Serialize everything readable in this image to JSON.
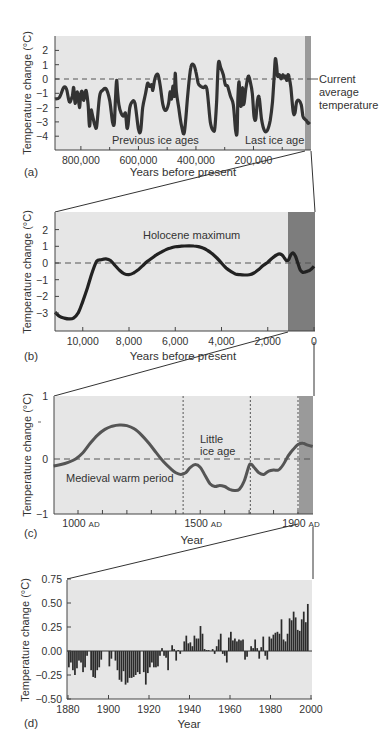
{
  "chart_data": [
    {
      "panel": "(a)",
      "type": "line",
      "title": "",
      "xlabel": "Years before present",
      "ylabel": "Temperature change (°C)",
      "x_tick_labels": [
        "800,000",
        "600,000",
        "400,000",
        "200,000"
      ],
      "y_tick_labels": [
        "2",
        "1",
        "0",
        "-1",
        "-2",
        "-3",
        "-4"
      ],
      "xlim": [
        890000,
        0
      ],
      "ylim": [
        -5,
        3
      ],
      "annotations": [
        "Previous ice ages",
        "Last ice age",
        "Current average temperature"
      ],
      "reference_line": {
        "y": 0,
        "style": "dashed",
        "label": "Current average temperature"
      },
      "highlight_region": {
        "x": [
          20000,
          0
        ],
        "color": "#9a9a9a"
      },
      "series": [
        {
          "name": "Temperature change",
          "x": [
            890000,
            875000,
            860000,
            850000,
            840000,
            830000,
            825000,
            820000,
            812000,
            805000,
            800000,
            795000,
            790000,
            782000,
            775000,
            770000,
            765000,
            760000,
            752000,
            745000,
            735000,
            725000,
            712000,
            700000,
            690000,
            684000,
            680000,
            676000,
            672000,
            668000,
            660000,
            652000,
            645000,
            640000,
            636000,
            630000,
            622000,
            612000,
            600000,
            592000,
            585000,
            575000,
            568000,
            562000,
            558000,
            554000,
            550000,
            545000,
            540000,
            532000,
            524000,
            515000,
            505000,
            495000,
            490000,
            485000,
            480000,
            475000,
            472000,
            468000,
            460000,
            450000,
            440000,
            428000,
            418000,
            408000,
            400000,
            392000,
            384000,
            374000,
            362000,
            350000,
            340000,
            334000,
            328000,
            322000,
            314000,
            305000,
            298000,
            290000,
            280000,
            270000,
            262000,
            257000,
            254000,
            250000,
            246000,
            242000,
            238000,
            234000,
            226000,
            218000,
            210000,
            204000,
            198000,
            192000,
            186000,
            180000,
            172000,
            162000,
            152000,
            142000,
            134000,
            128000,
            124000,
            120000,
            116000,
            110000,
            104000,
            98000,
            92000,
            88000,
            84000,
            80000,
            76000,
            70000,
            62000,
            56000,
            50000,
            42000,
            34000,
            28000,
            22000,
            16000,
            10000,
            4000
          ],
          "y": [
            -1.4,
            -1.3,
            -0.6,
            -0.7,
            -1.6,
            -1.2,
            -0.6,
            -1.7,
            -0.9,
            -2.0,
            -1.0,
            -0.9,
            -1.5,
            -0.8,
            -1.8,
            -3.3,
            -2.2,
            -2.5,
            -3.2,
            -3.3,
            -1.2,
            -0.8,
            -0.7,
            -1.5,
            -3.0,
            -3.1,
            -1.5,
            -0.1,
            -1.0,
            -1.8,
            -2.4,
            -2.6,
            -2.4,
            -3.4,
            -3.2,
            -2.0,
            -1.6,
            -1.7,
            -3.5,
            -3.6,
            -2.0,
            -1.0,
            -0.3,
            -0.5,
            -0.5,
            -0.4,
            -0.8,
            -0.2,
            0.2,
            0.3,
            -0.5,
            -1.8,
            -2.2,
            -1.7,
            -0.9,
            -1.4,
            -0.5,
            -1.2,
            0.4,
            -0.9,
            -2.0,
            -3.3,
            -3.7,
            -1.0,
            0.8,
            1.0,
            0.5,
            -0.3,
            -0.5,
            -0.6,
            -0.7,
            -3.0,
            -3.6,
            -3.4,
            -1.5,
            1.1,
            0.8,
            0.3,
            -0.4,
            -0.5,
            -1.2,
            -1.8,
            -3.6,
            -3.7,
            -1.3,
            -0.2,
            -1.7,
            -1.8,
            -0.6,
            -1.8,
            -0.6,
            0.2,
            -0.3,
            -1.0,
            -2.6,
            -2.8,
            -1.5,
            -1.3,
            -2.8,
            -3.6,
            -3.6,
            -2.9,
            -1.6,
            0.2,
            1.4,
            1.0,
            0.2,
            0.3,
            0.0,
            0.3,
            0.1,
            0.2,
            -0.1,
            0.3,
            0.1,
            -0.6,
            -2.3,
            -2.4,
            -1.6,
            -1.5,
            -1.8,
            -2.6,
            -2.8,
            -2.9,
            -3.1,
            -3.0
          ]
        }
      ]
    },
    {
      "panel": "(b)",
      "type": "line",
      "title": "",
      "xlabel": "Years before present",
      "ylabel": "Temperature change (°C)",
      "x_tick_labels": [
        "10,000",
        "8,000",
        "6,000",
        "4,000",
        "2,000",
        "0"
      ],
      "y_tick_labels": [
        "2",
        "1",
        "0",
        "-1",
        "-2",
        "-3"
      ],
      "xlim": [
        11200,
        0
      ],
      "ylim": [
        -4,
        3
      ],
      "annotations": [
        "Holocene maximum"
      ],
      "reference_line": {
        "y": 0,
        "style": "dashed"
      },
      "highlight_region": {
        "x": [
          1100,
          0
        ],
        "color": "#7d7d7d"
      },
      "series": [
        {
          "name": "Temperature change",
          "x": [
            11200,
            11000,
            10800,
            10600,
            10400,
            10200,
            10000,
            9800,
            9600,
            9400,
            9200,
            9000,
            8800,
            8600,
            8400,
            8200,
            8000,
            7800,
            7600,
            7400,
            7200,
            7000,
            6800,
            6600,
            6400,
            6200,
            6000,
            5800,
            5600,
            5400,
            5200,
            5000,
            4800,
            4600,
            4400,
            4200,
            4000,
            3800,
            3600,
            3400,
            3200,
            3000,
            2800,
            2600,
            2400,
            2200,
            2000,
            1800,
            1600,
            1500,
            1400,
            1300,
            1200,
            1100,
            1000,
            900,
            800,
            700,
            600,
            500,
            400,
            300,
            200,
            100,
            0
          ],
          "y": [
            -2.95,
            -3.2,
            -3.3,
            -3.35,
            -3.3,
            -3.0,
            -2.3,
            -1.5,
            -0.6,
            0.1,
            0.2,
            0.25,
            0.15,
            -0.15,
            -0.45,
            -0.65,
            -0.7,
            -0.6,
            -0.4,
            -0.15,
            0.1,
            0.3,
            0.5,
            0.65,
            0.8,
            0.9,
            0.97,
            1.0,
            1.02,
            1.03,
            1.02,
            0.98,
            0.9,
            0.75,
            0.55,
            0.3,
            0.0,
            -0.3,
            -0.5,
            -0.65,
            -0.7,
            -0.72,
            -0.7,
            -0.6,
            -0.4,
            -0.15,
            0.05,
            0.3,
            0.5,
            0.55,
            0.5,
            0.35,
            0.15,
            0.2,
            0.5,
            0.6,
            0.4,
            0.0,
            -0.4,
            -0.55,
            -0.55,
            -0.5,
            -0.45,
            -0.35,
            -0.2
          ]
        }
      ]
    },
    {
      "panel": "(c)",
      "type": "line",
      "title": "",
      "xlabel": "Year",
      "ylabel": "Temperature change (°C)",
      "x_tick_labels": [
        "1000 AD",
        "1500 AD",
        "1900 AD"
      ],
      "y_tick_labels": [
        "1",
        "0",
        "-1"
      ],
      "xlim": [
        900,
        1960
      ],
      "ylim": [
        -1,
        1
      ],
      "annotations": [
        "Medieval warm period",
        "Little ice age"
      ],
      "reference_line": {
        "y": 0,
        "style": "dashed"
      },
      "vertical_lines": [
        1430,
        1705,
        1900
      ],
      "highlight_region": {
        "x": [
          1905,
          1960
        ],
        "color": "#9a9a9a"
      },
      "series": [
        {
          "name": "Temperature change",
          "x": [
            900,
            930,
            960,
            990,
            1020,
            1050,
            1080,
            1110,
            1140,
            1170,
            1200,
            1230,
            1260,
            1290,
            1320,
            1350,
            1380,
            1400,
            1420,
            1440,
            1460,
            1480,
            1500,
            1520,
            1540,
            1560,
            1580,
            1600,
            1620,
            1640,
            1660,
            1680,
            1700,
            1710,
            1720,
            1740,
            1760,
            1780,
            1800,
            1820,
            1840,
            1860,
            1880,
            1900,
            1920,
            1940,
            1960
          ],
          "y": [
            -0.13,
            -0.1,
            -0.06,
            0.0,
            0.1,
            0.25,
            0.38,
            0.47,
            0.52,
            0.54,
            0.53,
            0.48,
            0.38,
            0.25,
            0.1,
            -0.05,
            -0.18,
            -0.25,
            -0.28,
            -0.25,
            -0.15,
            -0.1,
            -0.15,
            -0.3,
            -0.45,
            -0.5,
            -0.48,
            -0.5,
            -0.55,
            -0.57,
            -0.55,
            -0.4,
            -0.12,
            -0.1,
            -0.15,
            -0.25,
            -0.28,
            -0.22,
            -0.2,
            -0.2,
            -0.1,
            0.05,
            0.15,
            0.23,
            0.25,
            0.22,
            0.2
          ]
        }
      ]
    },
    {
      "panel": "(d)",
      "type": "bar",
      "title": "",
      "xlabel": "Year",
      "ylabel": "Temperature change (°C)",
      "x_tick_labels": [
        "1880",
        "1900",
        "1920",
        "1940",
        "1960",
        "1980",
        "2000"
      ],
      "y_tick_labels": [
        "0.75",
        "0.50",
        "0.25",
        "0.00",
        "-0.25",
        "-0.50"
      ],
      "xlim": [
        1880,
        2000
      ],
      "ylim": [
        -0.5,
        0.75
      ],
      "categories": [
        1880,
        1881,
        1882,
        1883,
        1884,
        1885,
        1886,
        1887,
        1888,
        1889,
        1890,
        1891,
        1892,
        1893,
        1894,
        1895,
        1896,
        1897,
        1898,
        1899,
        1900,
        1901,
        1902,
        1903,
        1904,
        1905,
        1906,
        1907,
        1908,
        1909,
        1910,
        1911,
        1912,
        1913,
        1914,
        1915,
        1916,
        1917,
        1918,
        1919,
        1920,
        1921,
        1922,
        1923,
        1924,
        1925,
        1926,
        1927,
        1928,
        1929,
        1930,
        1931,
        1932,
        1933,
        1934,
        1935,
        1936,
        1937,
        1938,
        1939,
        1940,
        1941,
        1942,
        1943,
        1944,
        1945,
        1946,
        1947,
        1948,
        1949,
        1950,
        1951,
        1952,
        1953,
        1954,
        1955,
        1956,
        1957,
        1958,
        1959,
        1960,
        1961,
        1962,
        1963,
        1964,
        1965,
        1966,
        1967,
        1968,
        1969,
        1970,
        1971,
        1972,
        1973,
        1974,
        1975,
        1976,
        1977,
        1978,
        1979,
        1980,
        1981,
        1982,
        1983,
        1984,
        1985,
        1986,
        1987,
        1988,
        1989,
        1990,
        1991,
        1992,
        1993,
        1994,
        1995,
        1996,
        1997,
        1998
      ],
      "values": [
        -0.17,
        -0.12,
        -0.2,
        -0.25,
        -0.18,
        -0.1,
        -0.12,
        -0.22,
        -0.17,
        -0.05,
        0.0,
        -0.2,
        -0.27,
        -0.28,
        -0.2,
        -0.17,
        -0.09,
        -0.0,
        -0.0,
        -0.0,
        -0.16,
        -0.08,
        -0.0,
        -0.1,
        -0.2,
        -0.3,
        -0.32,
        -0.21,
        -0.35,
        -0.33,
        -0.28,
        -0.28,
        -0.27,
        -0.25,
        -0.22,
        -0.24,
        -0.0,
        -0.22,
        -0.35,
        -0.23,
        -0.17,
        -0.12,
        -0.17,
        -0.17,
        -0.16,
        -0.05,
        0.03,
        -0.05,
        -0.07,
        -0.2,
        0.0,
        0.06,
        0.02,
        -0.1,
        0.01,
        -0.03,
        -0.0,
        0.1,
        0.16,
        0.08,
        0.09,
        0.05,
        0.16,
        0.13,
        0.13,
        0.26,
        0.18,
        0.02,
        0.01,
        0.01,
        0.0,
        0.02,
        -0.03,
        0.05,
        0.12,
        0.18,
        -0.03,
        -0.05,
        -0.12,
        0.14,
        0.2,
        0.11,
        0.13,
        0.1,
        0.12,
        0.11,
        0.12,
        -0.09,
        -0.06,
        0.0,
        0.05,
        0.03,
        0.12,
        0.03,
        -0.08,
        0.04,
        0.15,
        -0.05,
        -0.09,
        0.15,
        0.13,
        0.17,
        0.19,
        0.2,
        0.18,
        0.33,
        0.12,
        0.1,
        0.18,
        0.34,
        0.32,
        0.41,
        0.35,
        0.22,
        0.21,
        0.33,
        0.41,
        0.3,
        0.49,
        0.64
      ]
    }
  ],
  "figure": {
    "panel_labels": [
      "(a)",
      "(b)",
      "(c)",
      "(d)"
    ],
    "colors": {
      "plot_background": "#e6e6e6",
      "curve": "#333333",
      "curve_c": "#555555",
      "bars": "#2b2b2b",
      "zero_line": "#555555",
      "highlight_a": "#9a9a9a",
      "highlight_b": "#7d7d7d",
      "highlight_c": "#9a9a9a"
    }
  }
}
